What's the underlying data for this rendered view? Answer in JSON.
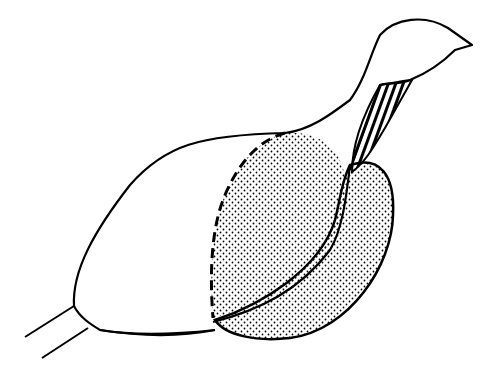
{
  "figure": {
    "type": "line-drawing",
    "regions": [
      {
        "name": "body-outline",
        "style": "solid-outline"
      },
      {
        "name": "head-neck",
        "style": "solid-outline"
      },
      {
        "name": "neck-stripe",
        "style": "hatched"
      },
      {
        "name": "inner-patch",
        "style": "stippled-dashed-outline"
      },
      {
        "name": "outer-patch",
        "style": "stippled-solid-outline"
      },
      {
        "name": "legs",
        "style": "lines"
      }
    ],
    "colors": {
      "ink": "#000000",
      "background": "#ffffff"
    }
  }
}
